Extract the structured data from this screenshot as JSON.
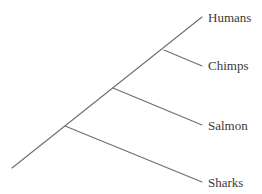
{
  "diagram": {
    "type": "cladogram",
    "line_color": "#6e6e6e",
    "text_color": "#3a3a3a",
    "taxa": [
      {
        "id": "humans",
        "label": "Humans"
      },
      {
        "id": "chimps",
        "label": "Chimps"
      },
      {
        "id": "salmon",
        "label": "Salmon"
      },
      {
        "id": "sharks",
        "label": "Sharks"
      }
    ],
    "tree": "(Sharks,(Salmon,(Chimps,Humans)))"
  }
}
